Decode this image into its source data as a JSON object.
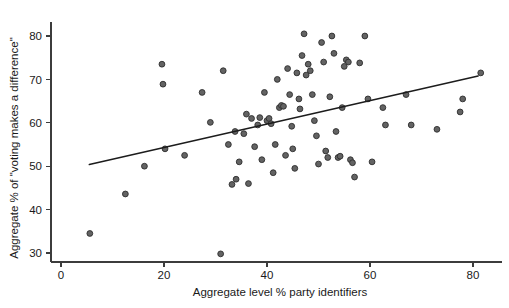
{
  "chart_data": {
    "type": "scatter",
    "title": "",
    "xlabel": "Aggregate level % party identifiers",
    "ylabel": "Aggregate % of \"voting makes a difference\"",
    "xlim": [
      0,
      85
    ],
    "ylim": [
      28,
      83
    ],
    "xticks": [
      0,
      20,
      40,
      60,
      80
    ],
    "yticks": [
      30,
      40,
      50,
      60,
      70,
      80
    ],
    "xtick_labels": [
      "0",
      "20",
      "40",
      "60",
      "80"
    ],
    "ytick_labels": [
      "30",
      "40",
      "50",
      "60",
      "70",
      "80"
    ],
    "grid": false,
    "legend": "none",
    "marker_color": "#636363",
    "marker_edge_color": "#2e2e2e",
    "line_color": "#1c1c1c",
    "axis_color": "#3c3c3c",
    "fit_line": {
      "name": "linear regression fit",
      "x_start": 5.5,
      "y_start": 50.4,
      "x_end": 81.0,
      "y_end": 70.8
    },
    "series": [
      {
        "name": "countries",
        "points": [
          [
            5.6,
            34.5
          ],
          [
            12.5,
            43.6
          ],
          [
            16.2,
            50.0
          ],
          [
            19.6,
            73.5
          ],
          [
            19.8,
            68.9
          ],
          [
            20.2,
            54.0
          ],
          [
            24.0,
            52.5
          ],
          [
            27.4,
            67.0
          ],
          [
            29.0,
            60.1
          ],
          [
            31.0,
            29.8
          ],
          [
            31.5,
            72.0
          ],
          [
            32.5,
            55.0
          ],
          [
            33.2,
            45.8
          ],
          [
            33.8,
            58.0
          ],
          [
            34.0,
            47.0
          ],
          [
            34.6,
            51.0
          ],
          [
            35.5,
            57.5
          ],
          [
            36.0,
            62.0
          ],
          [
            36.4,
            46.0
          ],
          [
            37.0,
            61.0
          ],
          [
            37.6,
            54.5
          ],
          [
            38.2,
            59.5
          ],
          [
            38.6,
            61.2
          ],
          [
            39.0,
            51.5
          ],
          [
            39.5,
            67.0
          ],
          [
            40.0,
            60.5
          ],
          [
            40.4,
            61.0
          ],
          [
            40.8,
            59.8
          ],
          [
            41.2,
            48.5
          ],
          [
            41.6,
            55.0
          ],
          [
            42.0,
            70.0
          ],
          [
            42.4,
            63.5
          ],
          [
            42.8,
            64.0
          ],
          [
            43.2,
            63.8
          ],
          [
            43.6,
            52.5
          ],
          [
            44.0,
            72.5
          ],
          [
            44.4,
            66.5
          ],
          [
            44.8,
            59.2
          ],
          [
            45.0,
            54.0
          ],
          [
            45.4,
            49.5
          ],
          [
            45.8,
            71.5
          ],
          [
            46.2,
            65.5
          ],
          [
            46.4,
            63.2
          ],
          [
            46.8,
            75.5
          ],
          [
            47.2,
            80.5
          ],
          [
            47.6,
            71.0
          ],
          [
            48.0,
            73.5
          ],
          [
            48.4,
            72.0
          ],
          [
            48.8,
            66.5
          ],
          [
            49.2,
            60.5
          ],
          [
            49.6,
            57.0
          ],
          [
            50.0,
            50.5
          ],
          [
            50.6,
            78.5
          ],
          [
            51.0,
            74.0
          ],
          [
            51.4,
            53.5
          ],
          [
            51.8,
            52.0
          ],
          [
            52.2,
            66.0
          ],
          [
            52.6,
            80.0
          ],
          [
            53.0,
            76.0
          ],
          [
            53.4,
            58.0
          ],
          [
            53.8,
            52.0
          ],
          [
            54.2,
            52.3
          ],
          [
            54.6,
            63.5
          ],
          [
            55.0,
            73.0
          ],
          [
            55.4,
            74.5
          ],
          [
            55.8,
            74.0
          ],
          [
            56.2,
            51.5
          ],
          [
            56.6,
            50.8
          ],
          [
            57.0,
            47.5
          ],
          [
            58.0,
            73.8
          ],
          [
            59.0,
            80.0
          ],
          [
            59.6,
            65.5
          ],
          [
            60.4,
            51.0
          ],
          [
            62.5,
            63.5
          ],
          [
            63.0,
            59.5
          ],
          [
            67.0,
            66.5
          ],
          [
            68.0,
            59.5
          ],
          [
            73.0,
            58.5
          ],
          [
            77.5,
            62.5
          ],
          [
            78.0,
            65.5
          ],
          [
            81.5,
            71.5
          ]
        ]
      }
    ]
  }
}
